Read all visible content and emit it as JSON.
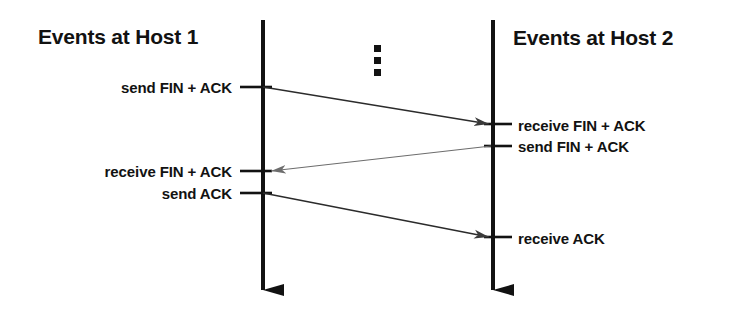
{
  "canvas": {
    "width": 751,
    "height": 327,
    "background": "#ffffff",
    "ink": "#121212",
    "thin_ink": "#2b2b2b"
  },
  "hosts": {
    "left": {
      "title": "Events at Host 1",
      "timeline_x": 263,
      "timeline_top": 20,
      "timeline_bottom": 310
    },
    "right": {
      "title": "Events at Host 2",
      "timeline_x": 493,
      "timeline_top": 20,
      "timeline_bottom": 310
    }
  },
  "continuation": {
    "icon": "vertical-ellipsis-icon",
    "dots": 3,
    "x": 378,
    "y_start": 49,
    "y_step": 12
  },
  "events": {
    "host1": [
      {
        "label": "send FIN + ACK",
        "y": 87
      },
      {
        "label": "receive FIN + ACK",
        "y": 171
      },
      {
        "label": "send ACK",
        "y": 193
      }
    ],
    "host2": [
      {
        "label": "receive FIN + ACK",
        "y": 125
      },
      {
        "label": "send FIN + ACK",
        "y": 146
      },
      {
        "label": "receive ACK",
        "y": 238
      }
    ]
  },
  "messages": [
    {
      "name": "fin-ack-host1-to-host2",
      "from": "host1",
      "to": "host2",
      "direction": "right",
      "x1": 263,
      "y1": 87,
      "x2": 489,
      "y2": 124
    },
    {
      "name": "fin-ack-host2-to-host1",
      "from": "host2",
      "to": "host1",
      "direction": "left",
      "x1": 491,
      "y1": 146,
      "x2": 267,
      "y2": 171
    },
    {
      "name": "ack-host1-to-host2",
      "from": "host1",
      "to": "host2",
      "direction": "right",
      "x1": 263,
      "y1": 193,
      "x2": 489,
      "y2": 237
    }
  ],
  "ticks": [
    {
      "name": "tick-h1-send-finack",
      "x1": 240,
      "x2": 272,
      "y": 87
    },
    {
      "name": "tick-h1-recv-finack",
      "x1": 240,
      "x2": 272,
      "y": 171
    },
    {
      "name": "tick-h1-send-ack",
      "x1": 240,
      "x2": 272,
      "y": 193
    },
    {
      "name": "tick-h2-recv-finack",
      "x1": 484,
      "x2": 512,
      "y": 124
    },
    {
      "name": "tick-h2-send-finack",
      "x1": 484,
      "x2": 512,
      "y": 146
    },
    {
      "name": "tick-h2-recv-ack",
      "x1": 484,
      "x2": 512,
      "y": 237
    }
  ]
}
